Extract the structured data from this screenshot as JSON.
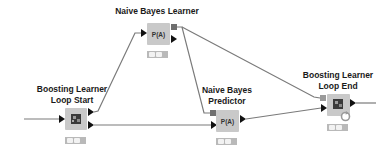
{
  "workflow": {
    "nodes": [
      {
        "id": "naive-bayes-learner",
        "label_lines": [
          "Naive Bayes Learner"
        ],
        "icon_text": "P(A)",
        "status_lights": 2
      },
      {
        "id": "boosting-learner-loop-start",
        "label_lines": [
          "Boosting Learner",
          "Loop Start"
        ],
        "icon_text": "",
        "status_lights": 2
      },
      {
        "id": "naive-bayes-predictor",
        "label_lines": [
          "Naive Bayes",
          "Predictor"
        ],
        "icon_text": "P(A)",
        "status_lights": 2
      },
      {
        "id": "boosting-learner-loop-end",
        "label_lines": [
          "Boosting Learner",
          "Loop End"
        ],
        "icon_text": "",
        "status_lights": 2
      }
    ],
    "connections": [
      {
        "from": "input",
        "to": "boosting-learner-loop-start"
      },
      {
        "from": "boosting-learner-loop-start",
        "to": "naive-bayes-learner"
      },
      {
        "from": "boosting-learner-loop-start",
        "to": "naive-bayes-predictor"
      },
      {
        "from": "naive-bayes-learner",
        "to": "naive-bayes-predictor",
        "port": "model"
      },
      {
        "from": "naive-bayes-learner",
        "to": "boosting-learner-loop-end",
        "port": "model"
      },
      {
        "from": "naive-bayes-predictor",
        "to": "boosting-learner-loop-end"
      },
      {
        "from": "boosting-learner-loop-end",
        "to": "output"
      }
    ],
    "colors": {
      "node_fill": "#c9c9c9",
      "connection": "#7a7a7a",
      "port_arrow": "#111111",
      "model_port": "#6e6e6e",
      "status_bar": "#b9b9b9"
    }
  }
}
